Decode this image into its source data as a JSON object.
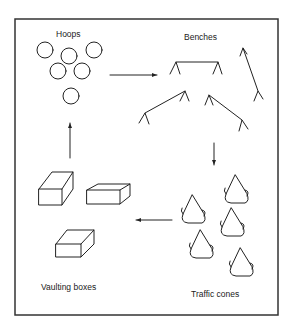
{
  "diagram": {
    "type": "circuit-layout",
    "stations": [
      {
        "id": "hoops",
        "label": "Hoops"
      },
      {
        "id": "benches",
        "label": "Benches"
      },
      {
        "id": "cones",
        "label": "Traffic cones"
      },
      {
        "id": "boxes",
        "label": "Vaulting boxes"
      }
    ],
    "flow": [
      "Hoops",
      "Benches",
      "Traffic cones",
      "Vaulting boxes",
      "Hoops"
    ],
    "colors": {
      "line": "#222222",
      "background": "#ffffff"
    }
  }
}
